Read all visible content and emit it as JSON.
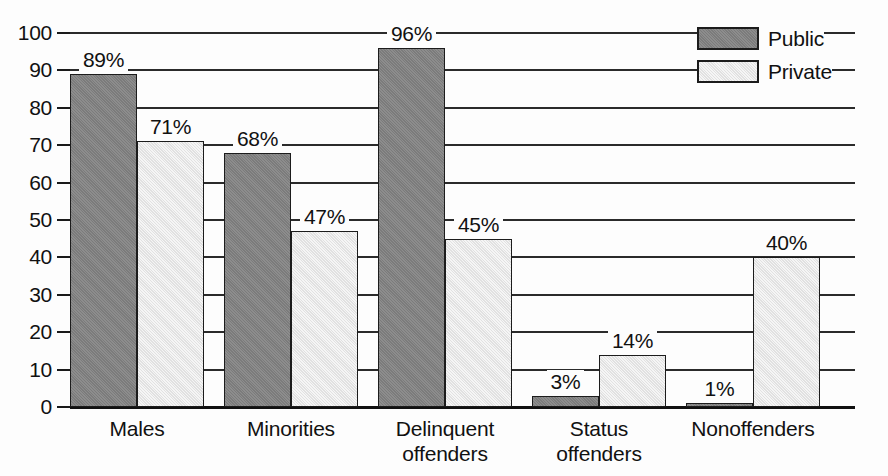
{
  "chart_data": {
    "type": "bar",
    "title": "",
    "xlabel": "",
    "ylabel": "",
    "ylim": [
      0,
      100
    ],
    "ytick_step": 10,
    "yticks": [
      "100",
      "90",
      "80",
      "70",
      "60",
      "50",
      "40",
      "30",
      "20",
      "10",
      "0"
    ],
    "grid": true,
    "grid_axis": "y",
    "legend_position": "top-right",
    "categories": [
      "Males",
      "Minorities",
      "Delinquent\noffenders",
      "Status\noffenders",
      "Nonoffenders"
    ],
    "series": [
      {
        "name": "Public",
        "color": "#828282",
        "values": [
          89,
          68,
          96,
          3,
          1
        ],
        "labels": [
          "89%",
          "68%",
          "96%",
          "3%",
          "1%"
        ]
      },
      {
        "name": "Private",
        "color": "#e9e9e9",
        "values": [
          71,
          47,
          45,
          14,
          40
        ],
        "labels": [
          "71%",
          "47%",
          "45%",
          "14%",
          "40%"
        ]
      }
    ]
  },
  "legend": {
    "items": [
      {
        "label": "Public",
        "swatch": "public"
      },
      {
        "label": "Private",
        "swatch": "private"
      }
    ]
  }
}
